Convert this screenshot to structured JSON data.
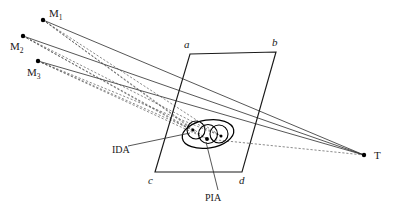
{
  "figure": {
    "background_color": "#ffffff",
    "line_color": "#2b2b2b",
    "dot_color": "#000000",
    "labels": {
      "m1": "M",
      "m1_sub": "1",
      "m2": "M",
      "m2_sub": "2",
      "m3": "M",
      "m3_sub": "3",
      "a": "a",
      "b": "b",
      "c": "c",
      "d": "d",
      "t": "T",
      "ida": "IDA",
      "pia": "PIA"
    },
    "points": {
      "m1": {
        "x": 43,
        "y": 20
      },
      "m2": {
        "x": 23,
        "y": 36
      },
      "m3": {
        "x": 38,
        "y": 61
      },
      "t": {
        "x": 364,
        "y": 155
      },
      "a": {
        "x": 190,
        "y": 54
      },
      "b": {
        "x": 276,
        "y": 52
      },
      "c": {
        "x": 155,
        "y": 172
      },
      "d": {
        "x": 242,
        "y": 172
      },
      "p1": {
        "x": 193,
        "y": 130
      },
      "p2": {
        "x": 207,
        "y": 139
      },
      "p3": {
        "x": 221,
        "y": 136
      }
    },
    "plane": {
      "name": "image-plane-parallelogram",
      "vertices": "190,54 276,52 242,172 155,172"
    },
    "ida_ellipse": {
      "cx": 208,
      "cy": 134,
      "rx": 26,
      "ry": 14,
      "rotation": -9
    },
    "pia_circles": [
      {
        "cx": 196,
        "cy": 130,
        "r": 9
      },
      {
        "cx": 208,
        "cy": 134,
        "r": 9.5
      },
      {
        "cx": 219,
        "cy": 134,
        "r": 9
      }
    ],
    "leader_lines": {
      "ida": {
        "x1": 128,
        "y1": 146,
        "x2": 190,
        "y2": 133
      },
      "pia": {
        "x1": 218,
        "y1": 190,
        "x2": 206,
        "y2": 142
      }
    },
    "solid_rays": [
      {
        "from": "m1",
        "to": "t"
      },
      {
        "from": "m2",
        "to": "t"
      },
      {
        "from": "m3",
        "to": "t"
      }
    ],
    "dashed_rays": [
      {
        "from": "m1",
        "to": "p1"
      },
      {
        "from": "m1",
        "to": "p2"
      },
      {
        "from": "m1",
        "to": "p3"
      },
      {
        "from": "m2",
        "to": "p1"
      },
      {
        "from": "m2",
        "to": "p2"
      },
      {
        "from": "m2",
        "to": "p3"
      },
      {
        "from": "m3",
        "to": "p1"
      },
      {
        "from": "m3",
        "to": "p2"
      },
      {
        "from": "m3",
        "to": "p3"
      },
      {
        "from": "p2",
        "to": "t"
      }
    ],
    "label_positions": {
      "m1": {
        "x": 49,
        "y": 17
      },
      "m2": {
        "x": 10,
        "y": 50
      },
      "m3": {
        "x": 27,
        "y": 76
      },
      "a": {
        "x": 184,
        "y": 48
      },
      "b": {
        "x": 272,
        "y": 46
      },
      "c": {
        "x": 148,
        "y": 184
      },
      "d": {
        "x": 239,
        "y": 184
      },
      "t": {
        "x": 374,
        "y": 159
      },
      "ida": {
        "x": 112,
        "y": 153
      },
      "pia": {
        "x": 205,
        "y": 201
      }
    }
  }
}
